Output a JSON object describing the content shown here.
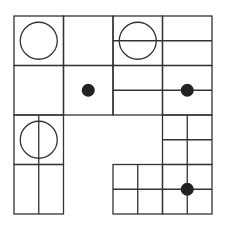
{
  "diagram": {
    "stroke_color": "#333333",
    "dot_color": "#222222",
    "background": "#ffffff",
    "grid": {
      "x0": 14,
      "y0": 16,
      "cell": 49.5,
      "cols": 4,
      "rows": 4
    },
    "blocks": [
      {
        "col": 0,
        "row": 0,
        "hline": false,
        "vline": false,
        "circle": true
      },
      {
        "col": 1,
        "row": 0,
        "hline": false,
        "vline": false
      },
      {
        "col": 2,
        "row": 0,
        "hline": true,
        "vline": false,
        "circle": true
      },
      {
        "col": 3,
        "row": 0,
        "hline": true,
        "vline": false
      },
      {
        "col": 0,
        "row": 1,
        "hline": false,
        "vline": false
      },
      {
        "col": 1,
        "row": 1,
        "hline": false,
        "vline": false,
        "dot": "center"
      },
      {
        "col": 2,
        "row": 1,
        "hline": true,
        "vline": false
      },
      {
        "col": 3,
        "row": 1,
        "hline": true,
        "vline": false,
        "dot": "mid-right"
      },
      {
        "col": 0,
        "row": 2,
        "hline": false,
        "vline": true,
        "circle": true
      },
      {
        "col": 3,
        "row": 2,
        "hline": true,
        "vline": true
      },
      {
        "col": 0,
        "row": 3,
        "hline": false,
        "vline": true
      },
      {
        "col": 2,
        "row": 3,
        "hline": true,
        "vline": true
      },
      {
        "col": 3,
        "row": 3,
        "hline": true,
        "vline": true,
        "dot": "intersection"
      }
    ],
    "missing_blocks": [
      {
        "col": 1,
        "row": 2
      },
      {
        "col": 2,
        "row": 2
      },
      {
        "col": 1,
        "row": 3
      }
    ]
  }
}
